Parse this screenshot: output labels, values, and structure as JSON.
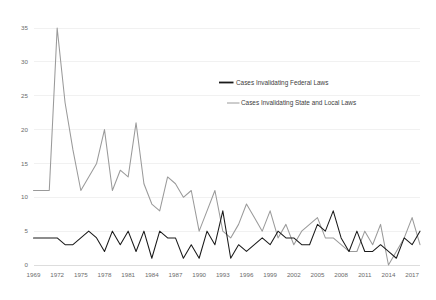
{
  "chart_data": {
    "type": "line",
    "title": "",
    "xlabel": "",
    "ylabel": "",
    "xlim": [
      1969,
      2018
    ],
    "ylim": [
      0,
      35
    ],
    "grid": true,
    "legend_position": "inside-right-upper",
    "y_ticks": [
      0,
      5,
      10,
      15,
      20,
      25,
      30,
      35
    ],
    "x_ticks": [
      1969,
      1972,
      1975,
      1978,
      1981,
      1984,
      1987,
      1990,
      1993,
      1996,
      1999,
      2002,
      2005,
      2008,
      2011,
      2014,
      2017
    ],
    "x": [
      1969,
      1970,
      1971,
      1972,
      1973,
      1974,
      1975,
      1976,
      1977,
      1978,
      1979,
      1980,
      1981,
      1982,
      1983,
      1984,
      1985,
      1986,
      1987,
      1988,
      1989,
      1990,
      1991,
      1992,
      1993,
      1994,
      1995,
      1996,
      1997,
      1998,
      1999,
      2000,
      2001,
      2002,
      2003,
      2004,
      2005,
      2006,
      2007,
      2008,
      2009,
      2010,
      2011,
      2012,
      2013,
      2014,
      2015,
      2016,
      2017,
      2018
    ],
    "series": [
      {
        "name": "Cases Invalidating Federal Laws",
        "color": "#1a1a1a",
        "values": [
          4,
          4,
          4,
          4,
          3,
          3,
          4,
          5,
          4,
          2,
          5,
          3,
          5,
          2,
          5,
          1,
          5,
          4,
          4,
          1,
          3,
          1,
          5,
          3,
          8,
          1,
          3,
          2,
          3,
          4,
          3,
          5,
          4,
          4,
          3,
          3,
          6,
          5,
          8,
          4,
          2,
          5,
          2,
          2,
          3,
          2,
          1,
          4,
          3,
          5
        ]
      },
      {
        "name": "Cases Invalidating State and Local Laws",
        "color": "#9a9a9a",
        "values": [
          11,
          11,
          11,
          35,
          24,
          17,
          11,
          13,
          15,
          20,
          11,
          14,
          13,
          21,
          12,
          9,
          8,
          13,
          12,
          10,
          11,
          5,
          8,
          11,
          5,
          4,
          6,
          9,
          7,
          5,
          8,
          4,
          6,
          3,
          5,
          6,
          7,
          4,
          4,
          3,
          2,
          2,
          5,
          3,
          6,
          0,
          2,
          4,
          7,
          3
        ]
      }
    ]
  },
  "legend": {
    "items": [
      {
        "label": "Cases Invalidating Federal Laws",
        "color": "#1a1a1a"
      },
      {
        "label": "Cases Invalidating State and Local Laws",
        "color": "#9a9a9a"
      }
    ]
  }
}
